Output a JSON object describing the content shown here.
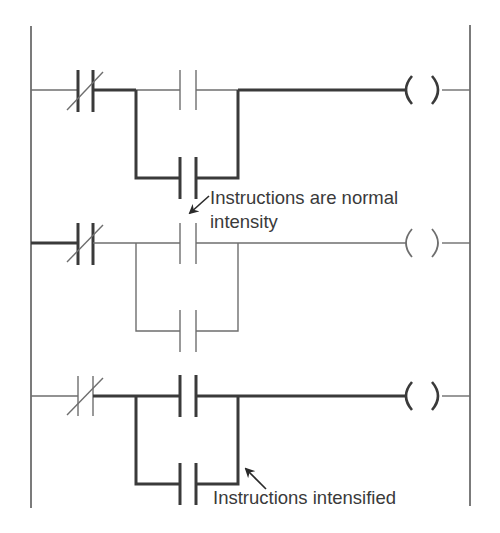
{
  "diagram": {
    "type": "ladder-logic",
    "rails": {
      "left_x": 31,
      "right_x": 470,
      "top_y": 26,
      "bottom_y": 508
    },
    "colors": {
      "thick_line": "#3a3a3a",
      "thin_line": "#6e6e6e",
      "text": "#3a3a3a",
      "background": "#ffffff"
    },
    "rungs": [
      {
        "id": 1,
        "y": 90,
        "nc_contact": {
          "intensified": true,
          "lead_in_intensified": false
        },
        "series_contact": {
          "intensified": false
        },
        "parallel_branch_contact": {
          "intensified": true
        },
        "output_wire_intensified": true,
        "coil": {
          "symbol": "( )",
          "intensified": true
        }
      },
      {
        "id": 2,
        "y": 243,
        "nc_contact": {
          "intensified": true,
          "lead_in_intensified": true
        },
        "series_contact": {
          "intensified": false
        },
        "parallel_branch_contact": {
          "intensified": false
        },
        "output_wire_intensified": false,
        "coil": {
          "symbol": "( )",
          "intensified": false
        }
      },
      {
        "id": 3,
        "y": 396,
        "nc_contact": {
          "intensified": false,
          "lead_in_intensified": false
        },
        "series_contact": {
          "intensified": true
        },
        "parallel_branch_contact": {
          "intensified": true
        },
        "output_wire_intensified": true,
        "coil": {
          "symbol": "( )",
          "intensified": true
        }
      }
    ],
    "annotations": {
      "normal": {
        "line1": "Instructions are normal",
        "line2": "intensity"
      },
      "intensified": {
        "text": "Instructions intensified"
      }
    }
  }
}
